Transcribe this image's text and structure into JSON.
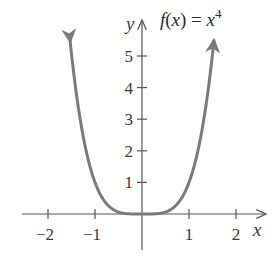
{
  "chart_data": {
    "type": "line",
    "title_parts": {
      "lhs": "f(x) = x",
      "exponent": "4"
    },
    "xlabel": "x",
    "ylabel": "y",
    "xlim": [
      -2.5,
      2.6
    ],
    "ylim": [
      0,
      6
    ],
    "grid": false,
    "legend": null,
    "x_ticks": [
      -2,
      -1,
      1,
      2
    ],
    "x_tick_labels": [
      "−2",
      "−1",
      "1",
      "2"
    ],
    "y_ticks": [
      1,
      2,
      3,
      4,
      5
    ],
    "y_tick_labels": [
      "1",
      "2",
      "3",
      "4",
      "5"
    ],
    "series": [
      {
        "name": "f(x) = x^4",
        "function": "x^4",
        "domain": [
          -1.53,
          1.53
        ],
        "arrows_at_ends": true,
        "x": [
          -1.5,
          -1.25,
          -1.0,
          -0.75,
          -0.5,
          -0.25,
          0,
          0.25,
          0.5,
          0.75,
          1.0,
          1.25,
          1.5
        ],
        "values": [
          5.06,
          2.44,
          1.0,
          0.32,
          0.06,
          0.004,
          0,
          0.004,
          0.06,
          0.32,
          1.0,
          2.44,
          5.06
        ]
      }
    ]
  },
  "colors": {
    "curve": "#7a7a7a",
    "axes": "#555555",
    "text": "#3a3a3a",
    "background": "#ffffff"
  }
}
